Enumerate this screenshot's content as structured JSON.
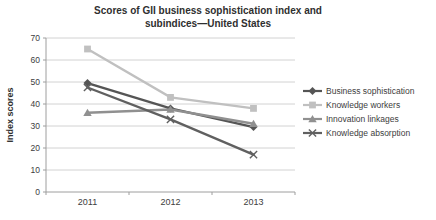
{
  "chart_data": {
    "type": "line",
    "title": "Scores of GII business sophistication index and subindices—United States",
    "title_lines": [
      "Scores of GII business sophistication index and",
      "subindices—United States"
    ],
    "xlabel": "",
    "ylabel": "Index scores",
    "categories": [
      "2011",
      "2012",
      "2013"
    ],
    "series": [
      {
        "name": "Business sophistication",
        "values": [
          49.5,
          38,
          29.5
        ],
        "color": "#555555",
        "marker": "diamond"
      },
      {
        "name": "Knowledge workers",
        "values": [
          65,
          43,
          38
        ],
        "color": "#c0c0c0",
        "marker": "square"
      },
      {
        "name": "Innovation linkages",
        "values": [
          36,
          37.5,
          31
        ],
        "color": "#909090",
        "marker": "triangle"
      },
      {
        "name": "Knowledge absorption",
        "values": [
          47.5,
          33,
          17
        ],
        "color": "#606060",
        "marker": "x"
      }
    ],
    "ylim": [
      0,
      70
    ],
    "ytick_step": 10,
    "ytick_labels": [
      "0",
      "10",
      "20",
      "30",
      "40",
      "50",
      "60",
      "70"
    ],
    "grid": true,
    "legend_position": "right",
    "colors": {
      "grid": "#d2d2d2",
      "axis": "#9e9e9e",
      "text": "#3d3d3d",
      "background": "#ffffff"
    }
  }
}
